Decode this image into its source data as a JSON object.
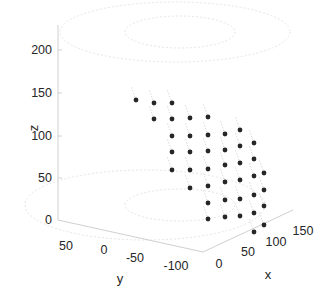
{
  "chart_data": {
    "type": "scatter3d",
    "title": "",
    "xlabel": "x",
    "ylabel": "y",
    "zlabel": "z",
    "xticks": [
      "0",
      "50",
      "100",
      "150"
    ],
    "yticks": [
      "50",
      "0",
      "-50",
      "-100"
    ],
    "zticks": [
      "0",
      "50",
      "100",
      "150",
      "200"
    ],
    "xlim": [
      0,
      160
    ],
    "ylim": [
      -120,
      70
    ],
    "zlim": [
      0,
      230
    ],
    "grid": false,
    "marker_color": "#262626",
    "quiver_color": "#c8c8c8",
    "decorations": "faint dotted ellipses at z=0 and z=200 planes",
    "points_screen_px": [
      [
        136,
        100
      ],
      [
        154,
        103
      ],
      [
        172,
        103
      ],
      [
        154,
        119
      ],
      [
        172,
        119
      ],
      [
        190,
        118
      ],
      [
        208,
        117
      ],
      [
        172,
        136
      ],
      [
        190,
        136
      ],
      [
        208,
        135
      ],
      [
        225,
        134
      ],
      [
        240,
        130
      ],
      [
        172,
        152
      ],
      [
        190,
        152
      ],
      [
        208,
        151
      ],
      [
        225,
        150
      ],
      [
        240,
        146
      ],
      [
        254,
        143
      ],
      [
        172,
        170
      ],
      [
        190,
        170
      ],
      [
        208,
        169
      ],
      [
        225,
        165
      ],
      [
        240,
        163
      ],
      [
        254,
        159
      ],
      [
        190,
        188
      ],
      [
        208,
        186
      ],
      [
        225,
        182
      ],
      [
        240,
        180
      ],
      [
        254,
        176
      ],
      [
        264,
        173
      ],
      [
        208,
        203
      ],
      [
        225,
        200
      ],
      [
        240,
        199
      ],
      [
        254,
        195
      ],
      [
        264,
        190
      ],
      [
        208,
        219
      ],
      [
        225,
        217
      ],
      [
        240,
        216
      ],
      [
        254,
        213
      ],
      [
        264,
        206
      ],
      [
        254,
        232
      ],
      [
        264,
        225
      ]
    ]
  },
  "axes": {
    "z_tick_labels": [
      {
        "label": "200",
        "y": 50
      },
      {
        "label": "150",
        "y": 93
      },
      {
        "label": "100",
        "y": 136
      },
      {
        "label": "50",
        "y": 178
      },
      {
        "label": "0",
        "y": 220
      }
    ],
    "y_tick_labels": [
      {
        "label": "50",
        "x": 66,
        "y": 246
      },
      {
        "label": "0",
        "x": 104,
        "y": 250
      },
      {
        "label": "-50",
        "x": 135,
        "y": 258
      },
      {
        "label": "-100",
        "x": 176,
        "y": 266
      }
    ],
    "x_tick_labels": [
      {
        "label": "0",
        "x": 219,
        "y": 264
      },
      {
        "label": "50",
        "x": 248,
        "y": 252
      },
      {
        "label": "100",
        "x": 276,
        "y": 242
      },
      {
        "label": "150",
        "x": 303,
        "y": 231
      }
    ],
    "x_label": "x",
    "y_label": "y",
    "z_label": "z"
  }
}
